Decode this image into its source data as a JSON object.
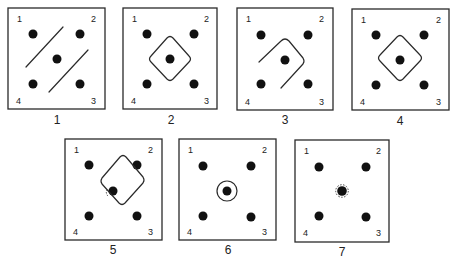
{
  "figure": {
    "corner_labels": [
      "1",
      "2",
      "3",
      "4"
    ],
    "panels": [
      {
        "id": "1",
        "caption": "1",
        "shape": "two-diagonal-lines"
      },
      {
        "id": "2",
        "caption": "2",
        "shape": "diamond-around-center"
      },
      {
        "id": "3",
        "caption": "3",
        "shape": "open-diamond-around-center"
      },
      {
        "id": "4",
        "caption": "4",
        "shape": "diamond-around-center"
      },
      {
        "id": "5",
        "caption": "5",
        "shape": "shifted-diamond-touching-dot-2"
      },
      {
        "id": "6",
        "caption": "6",
        "shape": "circle-around-center"
      },
      {
        "id": "7",
        "caption": "7",
        "shape": "dotted-halo-center"
      }
    ]
  },
  "colors": {
    "ink": "#111111",
    "line": "#2a2a2a",
    "background": "#ffffff"
  }
}
